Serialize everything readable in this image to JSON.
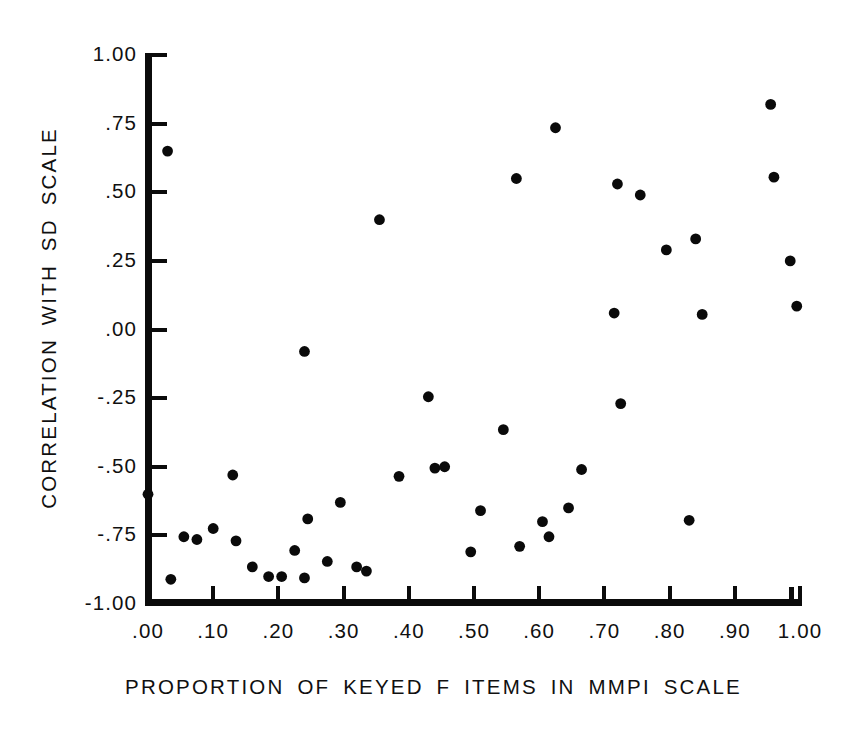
{
  "chart_data": {
    "type": "scatter",
    "title": "",
    "xlabel": "PROPORTION OF KEYED F ITEMS IN MMPI SCALE",
    "ylabel": "CORRELATION WITH SD SCALE",
    "xlim": [
      0.0,
      1.0
    ],
    "ylim": [
      -1.0,
      1.0
    ],
    "grid": false,
    "legend": null,
    "marker": "filled-circle",
    "marker_color": "#0a0a0a",
    "xticks": [
      0.0,
      0.1,
      0.2,
      0.3,
      0.4,
      0.5,
      0.6,
      0.7,
      0.8,
      0.9,
      1.0
    ],
    "xtick_labels": [
      ".00",
      ".10",
      ".20",
      ".30",
      ".40",
      ".50",
      ".60",
      ".70",
      ".80",
      ".90",
      "1.00"
    ],
    "yticks": [
      1.0,
      0.75,
      0.5,
      0.25,
      0.0,
      -0.25,
      -0.5,
      -0.75,
      -1.0
    ],
    "ytick_labels": [
      "1.00",
      ".75",
      ".50",
      ".25",
      ".00",
      "-.25",
      "-.50",
      "-.75",
      "-1.00"
    ],
    "points": [
      {
        "x": 0.0,
        "y": -0.6
      },
      {
        "x": 0.03,
        "y": 0.65
      },
      {
        "x": 0.035,
        "y": -0.91
      },
      {
        "x": 0.055,
        "y": -0.755
      },
      {
        "x": 0.075,
        "y": -0.765
      },
      {
        "x": 0.1,
        "y": -0.725
      },
      {
        "x": 0.13,
        "y": -0.53
      },
      {
        "x": 0.135,
        "y": -0.77
      },
      {
        "x": 0.16,
        "y": -0.865
      },
      {
        "x": 0.185,
        "y": -0.9
      },
      {
        "x": 0.205,
        "y": -0.9
      },
      {
        "x": 0.225,
        "y": -0.805
      },
      {
        "x": 0.24,
        "y": -0.08
      },
      {
        "x": 0.24,
        "y": -0.905
      },
      {
        "x": 0.245,
        "y": -0.69
      },
      {
        "x": 0.275,
        "y": -0.845
      },
      {
        "x": 0.295,
        "y": -0.63
      },
      {
        "x": 0.32,
        "y": -0.865
      },
      {
        "x": 0.335,
        "y": -0.88
      },
      {
        "x": 0.355,
        "y": 0.4
      },
      {
        "x": 0.385,
        "y": -0.535
      },
      {
        "x": 0.43,
        "y": -0.245
      },
      {
        "x": 0.44,
        "y": -0.505
      },
      {
        "x": 0.455,
        "y": -0.5
      },
      {
        "x": 0.495,
        "y": -0.81
      },
      {
        "x": 0.51,
        "y": -0.66
      },
      {
        "x": 0.545,
        "y": -0.365
      },
      {
        "x": 0.565,
        "y": 0.55
      },
      {
        "x": 0.57,
        "y": -0.79
      },
      {
        "x": 0.605,
        "y": -0.7
      },
      {
        "x": 0.615,
        "y": -0.755
      },
      {
        "x": 0.625,
        "y": 0.735
      },
      {
        "x": 0.645,
        "y": -0.65
      },
      {
        "x": 0.665,
        "y": -0.51
      },
      {
        "x": 0.715,
        "y": 0.06
      },
      {
        "x": 0.72,
        "y": 0.53
      },
      {
        "x": 0.725,
        "y": -0.27
      },
      {
        "x": 0.755,
        "y": 0.49
      },
      {
        "x": 0.795,
        "y": 0.29
      },
      {
        "x": 0.83,
        "y": -0.695
      },
      {
        "x": 0.84,
        "y": 0.33
      },
      {
        "x": 0.85,
        "y": 0.055
      },
      {
        "x": 0.955,
        "y": 0.82
      },
      {
        "x": 0.96,
        "y": 0.555
      },
      {
        "x": 0.985,
        "y": 0.25
      },
      {
        "x": 0.995,
        "y": 0.085
      }
    ],
    "n_points": 46
  }
}
